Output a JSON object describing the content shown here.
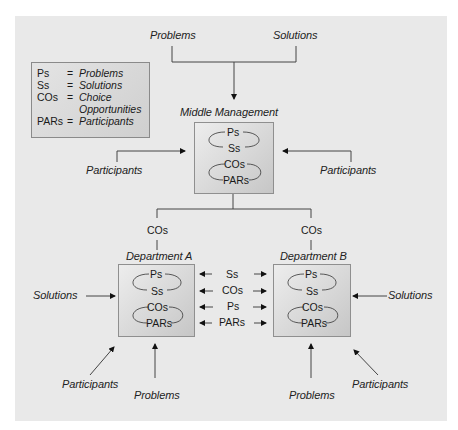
{
  "top_inputs": {
    "problems": "Problems",
    "solutions": "Solutions"
  },
  "legend": {
    "rows": [
      {
        "key": "Ps",
        "eq": "=",
        "value": "Problems"
      },
      {
        "key": "Ss",
        "eq": "=",
        "value": "Solutions"
      },
      {
        "key": "COs",
        "eq": "=",
        "value": "Choice"
      },
      {
        "key": "",
        "eq": "",
        "value": "Opportunities"
      },
      {
        "key": "PARs",
        "eq": "=",
        "value": "Participants"
      }
    ]
  },
  "middle_management": {
    "title": "Middle Management",
    "cycle": [
      "Ps",
      "Ss",
      "COs",
      "PARs"
    ],
    "left_input": "Participants",
    "right_input": "Participants"
  },
  "branches": {
    "left_label": "COs",
    "right_label": "COs"
  },
  "department_a": {
    "title": "Department A",
    "cycle": [
      "Ps",
      "Ss",
      "COs",
      "PARs"
    ],
    "left_input": "Solutions",
    "bottom_inputs": {
      "participants": "Participants",
      "problems": "Problems"
    }
  },
  "department_b": {
    "title": "Department B",
    "cycle": [
      "Ps",
      "Ss",
      "COs",
      "PARs"
    ],
    "right_input": "Solutions",
    "bottom_inputs": {
      "participants": "Participants",
      "problems": "Problems"
    }
  },
  "exchanges": [
    "Ss",
    "COs",
    "Ps",
    "PARs"
  ]
}
